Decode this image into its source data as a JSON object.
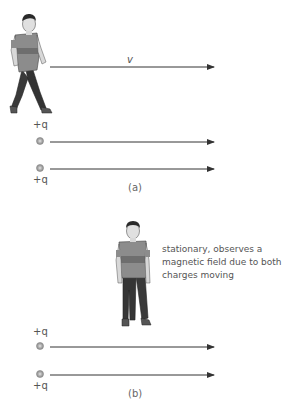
{
  "panel_a": {
    "caption": "(a)",
    "velocity_label": "v",
    "charges": [
      {
        "label": "+q",
        "position": "top"
      },
      {
        "label": "+q",
        "position": "bottom"
      }
    ],
    "observer": "walking person moving with velocity v"
  },
  "panel_b": {
    "caption": "(b)",
    "observer_note": [
      "stationary, observes a",
      "magnetic field due to both",
      "charges moving"
    ],
    "charges": [
      {
        "label": "+q",
        "position": "top"
      },
      {
        "label": "+q",
        "position": "bottom"
      }
    ],
    "observer": "standing person"
  },
  "colors": {
    "arrow": "#333333",
    "charge_fill": "#9a9a9a",
    "shirt": "#8c8c8c",
    "stripe": "#6e6e6e",
    "pants": "#3a3a3a",
    "skin": "#d8d8d8",
    "hair": "#2a2a2a"
  }
}
